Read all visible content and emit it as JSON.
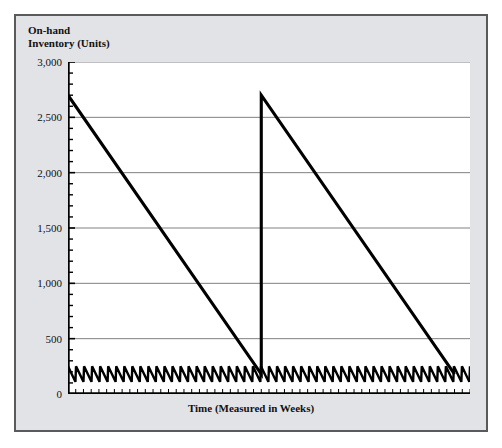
{
  "figure": {
    "background_color": "#e2e3e6",
    "border_color": "#5a5a5a",
    "plot_background_color": "#ffffff"
  },
  "axis": {
    "y_title": "On-hand\nInventory (Units)",
    "x_title": "Time (Measured in Weeks)"
  },
  "chart_data": {
    "type": "line",
    "title": "",
    "xlabel": "Time (Measured in Weeks)",
    "ylabel": "On-hand Inventory (Units)",
    "ylim": [
      0,
      3000
    ],
    "xlim": [
      0,
      52
    ],
    "ytick_labels": [
      "3,000",
      "2,500",
      "2,000",
      "1,500",
      "1,000",
      "500",
      "0"
    ],
    "ytick_values": [
      3000,
      2500,
      2000,
      1500,
      1000,
      500,
      0
    ],
    "y_minor_tick_step": 100,
    "x_minor_tick_step": 1,
    "x_major_tick_step": 2,
    "grid": "horizontal-major-only",
    "legend": "none",
    "line_color": "#000000",
    "grid_color": "#808080",
    "series": [
      {
        "name": "Large-lot replenishment cycle",
        "description": "Sawtooth: inventory received in large lots of 2,700 units then consumed linearly down to a 180-unit reorder point, twice across the year.",
        "points": [
          [
            0,
            2700
          ],
          [
            25,
            180
          ],
          [
            25,
            2700
          ],
          [
            50,
            180
          ]
        ]
      },
      {
        "name": "Small-lot (lean) replenishment cycle",
        "description": "High-frequency sawtooth oscillating between about 110 and 250 units, replenished roughly weekly.",
        "low_value": 110,
        "high_value": 250,
        "cycles": 50,
        "x_start": 0,
        "x_end": 52
      }
    ]
  }
}
